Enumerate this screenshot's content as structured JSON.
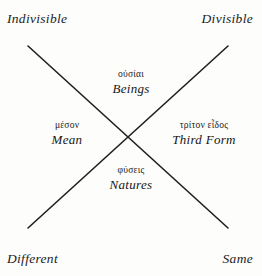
{
  "figure": {
    "type": "x-cross-diagram",
    "background_color": "#fdfdfb",
    "ink_color": "#1b1b1b"
  },
  "corners": {
    "top_left": "Indivisible",
    "top_right": "Divisible",
    "bottom_left": "Different",
    "bottom_right": "Same"
  },
  "quadrants": {
    "top": {
      "greek": "οὐσίαι",
      "english": "Beings"
    },
    "left": {
      "greek": "μέσον",
      "english": "Mean"
    },
    "right": {
      "greek": "τρίτον εἶδος",
      "english": "Third Form"
    },
    "bottom": {
      "greek": "φύσεις",
      "english": "Natures"
    }
  },
  "lines": {
    "stroke_color": "#1f1f1f",
    "stroke_width": 1.6,
    "diagonal_down": {
      "x1": 28,
      "y1": 46,
      "x2": 228,
      "y2": 228
    },
    "diagonal_up": {
      "x1": 228,
      "y1": 46,
      "x2": 28,
      "y2": 228
    },
    "intersection": {
      "x": 128,
      "y": 137
    }
  }
}
